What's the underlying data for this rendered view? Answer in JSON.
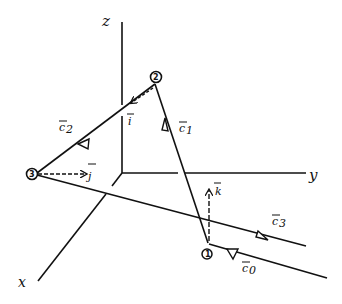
{
  "axes": {
    "x_label": "x",
    "y_label": "y",
    "z_label": "z"
  },
  "points": [
    {
      "id": "1",
      "label": "1"
    },
    {
      "id": "2",
      "label": "2"
    },
    {
      "id": "3",
      "label": "3"
    }
  ],
  "vectors": {
    "c0": "c⃗0",
    "c1": "c⃗1",
    "c2": "c⃗2",
    "c3": "c⃗3",
    "i": "i⃗",
    "j": "j⃗",
    "k": "k⃗"
  },
  "labels": {
    "c0_base": "c",
    "c0_sub": "0",
    "c1_base": "c",
    "c1_sub": "1",
    "c2_base": "c",
    "c2_sub": "2",
    "c3_base": "c",
    "c3_sub": "3",
    "i": "i",
    "j": "j",
    "k": "k"
  },
  "colors": {
    "ink": "#111111",
    "background": "#ffffff"
  }
}
